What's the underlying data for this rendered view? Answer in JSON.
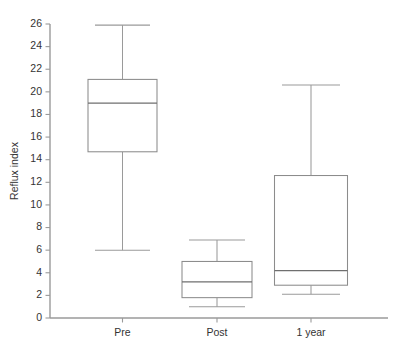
{
  "chart_data": {
    "type": "box",
    "title": "",
    "xlabel": "",
    "ylabel": "Reflux index",
    "ylim": [
      0,
      26
    ],
    "ytick_step": 2,
    "yticks": [
      0,
      2,
      4,
      6,
      8,
      10,
      12,
      14,
      16,
      18,
      20,
      22,
      24,
      26
    ],
    "ytick_labels": [
      "0",
      "2",
      "4",
      "6",
      "8",
      "10",
      "12",
      "14",
      "16",
      "18",
      "20",
      "22",
      "24",
      "26"
    ],
    "categories": [
      "Pre",
      "Post",
      "1 year"
    ],
    "grid": false,
    "legend": false,
    "boxes": [
      {
        "label": "Pre",
        "min": 6.0,
        "q1": 14.7,
        "median": 19.0,
        "q3": 21.1,
        "max": 25.9
      },
      {
        "label": "Post",
        "min": 1.0,
        "q1": 1.8,
        "median": 3.2,
        "q3": 5.0,
        "max": 6.9
      },
      {
        "label": "1 year",
        "min": 2.1,
        "q1": 2.9,
        "median": 4.2,
        "q3": 12.6,
        "max": 20.6
      }
    ]
  },
  "colors": {
    "axis": "#9a9a9a",
    "box_stroke": "#8c8c8c",
    "box_fill": "#ffffff",
    "median": "#6f6f6f",
    "whisker": "#9a9a9a",
    "text": "#333333",
    "background": "#ffffff"
  }
}
